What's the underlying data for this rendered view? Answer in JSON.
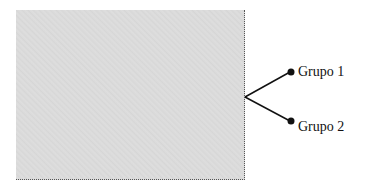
{
  "diagram": {
    "panel": {
      "fill_color": "#dadada",
      "border_style": "dotted"
    },
    "branch_origin": {
      "x": 245,
      "y": 97
    },
    "nodes": [
      {
        "id": "grupo-1",
        "label": "Grupo 1",
        "x": 290,
        "y": 72
      },
      {
        "id": "grupo-2",
        "label": "Grupo 2",
        "x": 290,
        "y": 121
      }
    ],
    "line_color": "#111111"
  }
}
